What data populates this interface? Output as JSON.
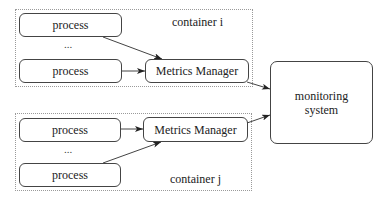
{
  "diagram": {
    "container_i": {
      "label": "container i",
      "processes": [
        {
          "label": "process"
        },
        {
          "label": "process"
        }
      ],
      "ellipsis": "...",
      "metrics_manager": {
        "label": "Metrics Manager"
      }
    },
    "container_j": {
      "label": "container j",
      "processes": [
        {
          "label": "process"
        },
        {
          "label": "process"
        }
      ],
      "ellipsis": "...",
      "metrics_manager": {
        "label": "Metrics Manager"
      }
    },
    "monitoring_system": {
      "label": "monitoring\nsystem"
    },
    "edges": [
      {
        "from": "container_i.process_1",
        "to": "container_i.metrics_manager"
      },
      {
        "from": "container_i.process_2",
        "to": "container_i.metrics_manager"
      },
      {
        "from": "container_j.process_1",
        "to": "container_j.metrics_manager"
      },
      {
        "from": "container_j.process_2",
        "to": "container_j.metrics_manager"
      },
      {
        "from": "container_i.metrics_manager",
        "to": "monitoring_system"
      },
      {
        "from": "container_j.metrics_manager",
        "to": "monitoring_system"
      }
    ],
    "colors": {
      "stroke": "#444444",
      "container_border": "#9a9a9a",
      "background": "#ffffff"
    }
  }
}
